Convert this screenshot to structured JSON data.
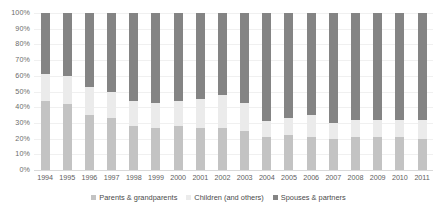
{
  "chart_data": {
    "type": "bar",
    "subtype": "stacked-percentage-column",
    "title": "",
    "subtitle": "",
    "xlabel": "",
    "ylabel": "",
    "ylim": [
      0,
      100
    ],
    "ytick_labels": [
      "100%",
      "90%",
      "80%",
      "70%",
      "60%",
      "50%",
      "40%",
      "30%",
      "20%",
      "10%",
      "0%"
    ],
    "ytick_values": [
      100,
      90,
      80,
      70,
      60,
      50,
      40,
      30,
      20,
      10,
      0
    ],
    "grid": true,
    "legend_position": "bottom",
    "categories": [
      "1994",
      "1995",
      "1996",
      "1997",
      "1998",
      "1999",
      "2000",
      "2001",
      "2002",
      "2003",
      "2004",
      "2005",
      "2006",
      "2007",
      "2008",
      "2009",
      "2010",
      "2011"
    ],
    "series": [
      {
        "name": "Parents & grandparents",
        "color": "#c3c3c3",
        "values": [
          44,
          42,
          35,
          33,
          28,
          27,
          28,
          27,
          27,
          25,
          21,
          22,
          21,
          20,
          21,
          21,
          21,
          20
        ]
      },
      {
        "name": "Children (and others)",
        "color": "#ebebeb",
        "values": [
          17,
          18,
          18,
          17,
          16,
          16,
          16,
          18,
          21,
          18,
          10,
          11,
          14,
          10,
          11,
          11,
          11,
          12
        ]
      },
      {
        "name": "Spouses & partners",
        "color": "#848484",
        "values": [
          39,
          40,
          47,
          50,
          56,
          57,
          56,
          55,
          52,
          57,
          69,
          67,
          65,
          70,
          68,
          68,
          68,
          68
        ]
      }
    ]
  },
  "legend": {
    "items": [
      {
        "label": "Parents & grandparents",
        "color": "#c3c3c3"
      },
      {
        "label": "Children (and others)",
        "color": "#ebebeb"
      },
      {
        "label": "Spouses & partners",
        "color": "#848484"
      }
    ]
  },
  "colors": {
    "background": "#ffffff",
    "gridline": "#f0f0f0",
    "axis": "#d9d9d9",
    "tick_text": "#6b6b6b"
  }
}
